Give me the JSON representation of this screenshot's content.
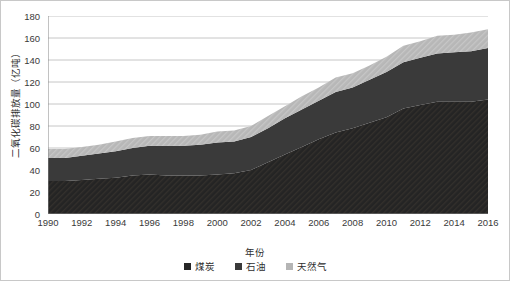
{
  "chart_data": {
    "type": "area",
    "stacked": true,
    "title": "",
    "xlabel": "年份",
    "ylabel": "二氧化碳排放量（亿吨）",
    "ylim": [
      0,
      180
    ],
    "ytick_step": 20,
    "yticks": [
      "0",
      "20",
      "40",
      "60",
      "80",
      "100",
      "120",
      "140",
      "160",
      "180"
    ],
    "xlim": [
      1990,
      2016
    ],
    "grid": true,
    "legend_position": "bottom",
    "x": [
      1990,
      1991,
      1992,
      1993,
      1994,
      1995,
      1996,
      1997,
      1998,
      1999,
      2000,
      2001,
      2002,
      2003,
      2004,
      2005,
      2006,
      2007,
      2008,
      2009,
      2010,
      2011,
      2012,
      2013,
      2014,
      2015,
      2016
    ],
    "xtick_labels": [
      "1990",
      "1992",
      "1994",
      "1996",
      "1998",
      "2000",
      "2002",
      "2004",
      "2006",
      "2008",
      "2010",
      "2012",
      "2014",
      "2016"
    ],
    "series": [
      {
        "name": "煤炭",
        "color": "#262626",
        "values": [
          30,
          30,
          31,
          32,
          33,
          35,
          36,
          35,
          35,
          35,
          36,
          37,
          40,
          47,
          54,
          61,
          68,
          74,
          78,
          83,
          88,
          96,
          99,
          102,
          102,
          102,
          104
        ]
      },
      {
        "name": "石油",
        "color": "#3a3a3a",
        "values": [
          21,
          21,
          22,
          23,
          24,
          25,
          26,
          27,
          27,
          28,
          29,
          29,
          30,
          31,
          33,
          34,
          35,
          37,
          37,
          39,
          41,
          42,
          43,
          44,
          45,
          46,
          47
        ]
      },
      {
        "name": "天然气",
        "color": "#b5b5b5",
        "values": [
          8,
          8,
          8,
          8,
          9,
          9,
          9,
          9,
          9,
          9,
          10,
          10,
          10,
          11,
          11,
          12,
          12,
          13,
          13,
          13,
          14,
          15,
          15,
          16,
          16,
          17,
          17
        ]
      }
    ],
    "totals": [
      59,
      59,
      61,
      63,
      66,
      69,
      71,
      71,
      71,
      72,
      75,
      76,
      80,
      89,
      98,
      107,
      115,
      124,
      128,
      135,
      143,
      153,
      157,
      162,
      163,
      165,
      168
    ],
    "styles": {
      "plot_background": "#ffffff",
      "gridline_color": "#c0c0c0",
      "axis_color": "#868686",
      "border_color": "#c8c8c8",
      "text_color": "#3a3a3a"
    }
  },
  "legend": {
    "items": [
      {
        "label": "煤炭",
        "color": "#262626"
      },
      {
        "label": "石油",
        "color": "#3a3a3a"
      },
      {
        "label": "天然气",
        "color": "#b5b5b5"
      }
    ]
  }
}
